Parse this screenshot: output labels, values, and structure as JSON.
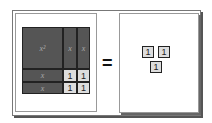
{
  "left_model": {
    "x2_label": "x²",
    "x_label": "x",
    "one_label": "1",
    "tiles": {
      "x_squared": 1,
      "x_vertical": 2,
      "x_horizontal": 2,
      "ones": 4
    }
  },
  "equals": "=",
  "right_model": {
    "one_label": "1",
    "ones": 3
  }
}
